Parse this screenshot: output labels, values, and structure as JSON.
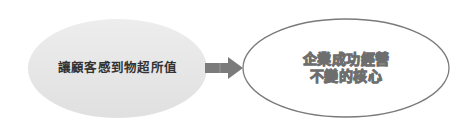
{
  "diagram": {
    "type": "flow",
    "direction": "left-to-right",
    "nodes": [
      {
        "id": "customer-value",
        "shape": "ellipse",
        "label": "讓顧客感到物超所值",
        "fill": "#e6e6e6",
        "text_color": "#333333"
      },
      {
        "id": "core-of-business",
        "shape": "ellipse",
        "label_lines": [
          "企業成功經營",
          "不變的核心"
        ],
        "fill": "#ffffff",
        "stroke": "#7a7a7a",
        "text_style": "outlined"
      }
    ],
    "edges": [
      {
        "from": "customer-value",
        "to": "core-of-business",
        "style": "block-arrow",
        "color": "#7a7a7a"
      }
    ]
  }
}
